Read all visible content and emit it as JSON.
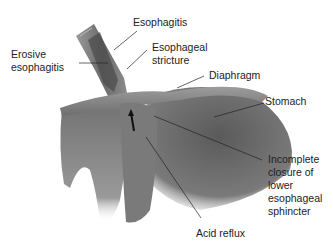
{
  "diagram": {
    "labels": {
      "esophagitis": "Esophagitis",
      "erosive_esophagitis": "Erosive\nesophagitis",
      "esophageal_stricture": "Esophageal\nstricture",
      "diaphragm": "Diaphragm",
      "stomach": "Stomach",
      "incomplete_closure": "Incomplete\nclosure of\nlower\nesophageal\nsphincter",
      "acid_reflux": "Acid reflux"
    }
  }
}
